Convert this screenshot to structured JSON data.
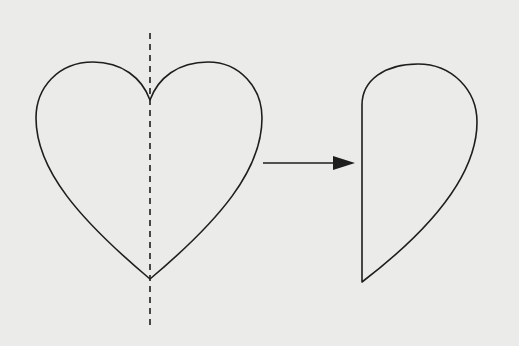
{
  "diagram": {
    "colors": {
      "background": "#ebebe9",
      "stroke": "#1e1e1e"
    },
    "elements": [
      {
        "id": "heart",
        "label": "Full heart shape"
      },
      {
        "id": "symmetry-line",
        "label": "Dashed vertical line of symmetry"
      },
      {
        "id": "arrow",
        "label": "Arrow pointing right"
      },
      {
        "id": "half-heart",
        "label": "Right half of heart after folding/cutting"
      }
    ]
  }
}
